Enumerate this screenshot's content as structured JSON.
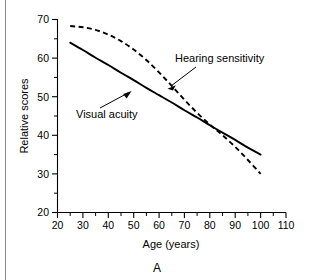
{
  "figure": {
    "panel_label": "A",
    "background_color": "#ffffff",
    "line_color": "#000000",
    "rule_color": "#8a8a8a"
  },
  "chart_data": {
    "type": "line",
    "title": "",
    "xlabel": "Age (years)",
    "ylabel": "Relative scores",
    "xlim": [
      20,
      110
    ],
    "ylim": [
      20,
      70
    ],
    "xticks": [
      20,
      30,
      40,
      50,
      60,
      70,
      80,
      90,
      100,
      110
    ],
    "xtick_labels": [
      "20",
      "30",
      "40",
      "50",
      "60",
      "70",
      "80",
      "90",
      "100",
      "110"
    ],
    "xminor_step": 5,
    "yticks": [
      20,
      30,
      40,
      50,
      60,
      70
    ],
    "ytick_labels": [
      "20",
      "30",
      "40",
      "50",
      "60",
      "70"
    ],
    "yminor_step": 5,
    "grid": false,
    "legend": "inline-annotations",
    "series": [
      {
        "name": "Visual acuity",
        "style": "solid",
        "color": "#000000",
        "x": [
          25,
          30,
          35,
          40,
          45,
          50,
          55,
          60,
          65,
          70,
          75,
          80,
          85,
          90,
          95,
          100
        ],
        "values": [
          64.0,
          62.1,
          60.1,
          58.2,
          56.2,
          54.3,
          52.3,
          50.4,
          48.5,
          46.5,
          44.6,
          42.6,
          40.7,
          38.8,
          36.8,
          35.0
        ]
      },
      {
        "name": "Hearing sensitivity",
        "style": "dashed",
        "color": "#000000",
        "x": [
          25,
          30,
          35,
          40,
          45,
          50,
          55,
          60,
          65,
          70,
          75,
          80,
          85,
          90,
          95,
          100
        ],
        "values": [
          68.3,
          68.0,
          67.3,
          66.1,
          64.4,
          62.2,
          59.5,
          56.3,
          52.8,
          49.2,
          45.8,
          42.8,
          40.0,
          37.0,
          33.6,
          30.0
        ]
      }
    ],
    "annotations": [
      {
        "text": "Hearing sensitivity",
        "points_to_series": "Hearing sensitivity",
        "point_x": 62,
        "point_y": 55
      },
      {
        "text": "Visual acuity",
        "points_to_series": "Visual acuity",
        "point_x": 54,
        "point_y": 52
      }
    ]
  }
}
